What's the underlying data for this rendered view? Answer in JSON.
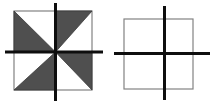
{
  "canvas": {
    "width": 222,
    "height": 106,
    "background": "#ffffff"
  },
  "palette": {
    "shade_fill": "#4f4f4f",
    "shade_edge": "#3a3a3a",
    "square_outline": "#828282",
    "cross_line": "#0e0e0e"
  },
  "figures": [
    {
      "id": "pinwheel-square-figure",
      "description": "square with center cross axes and four shaded right triangles arranged in a pinwheel (rotational symmetry)",
      "square": {
        "x": 14,
        "y": 11,
        "width": 78,
        "height": 79
      },
      "cross": {
        "vertical": {
          "x": 55.5,
          "y1": 3,
          "y2": 101,
          "thickness": 3
        },
        "horizontal": {
          "y": 52,
          "x1": 5,
          "x2": 103,
          "thickness": 3
        }
      },
      "shaded_triangles": [
        {
          "name": "shaded-triangle-top-left",
          "points": [
            [
              14,
              11
            ],
            [
              14,
              52
            ],
            [
              55.5,
              52
            ]
          ]
        },
        {
          "name": "shaded-triangle-top-right",
          "points": [
            [
              55.5,
              11
            ],
            [
              92,
              11
            ],
            [
              55.5,
              52
            ]
          ]
        },
        {
          "name": "shaded-triangle-bottom-right",
          "points": [
            [
              55.5,
              52
            ],
            [
              92,
              52
            ],
            [
              92,
              90
            ]
          ]
        },
        {
          "name": "shaded-triangle-bottom-left",
          "points": [
            [
              14,
              90
            ],
            [
              55.5,
              90
            ],
            [
              55.5,
              52
            ]
          ]
        }
      ]
    },
    {
      "id": "blank-square-figure",
      "description": "empty square with center cross axes",
      "square": {
        "x": 124,
        "y": 19,
        "width": 69,
        "height": 70
      },
      "cross": {
        "vertical": {
          "x": 164.5,
          "y1": 6,
          "y2": 100,
          "thickness": 3
        },
        "horizontal": {
          "y": 53.5,
          "x1": 114,
          "x2": 210,
          "thickness": 3
        }
      },
      "shaded_triangles": []
    }
  ]
}
